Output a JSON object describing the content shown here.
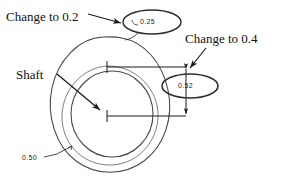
{
  "figure": {
    "background_color": "#ffffff",
    "line_color": "#3a3a3a",
    "text_color": "#111111"
  },
  "annotations": {
    "change_top": "Change to 0.2",
    "change_right": "Change to 0.4",
    "shaft": "Shaft"
  },
  "dimensions": {
    "top_value": "0.25",
    "right_value": "0.52",
    "bottom_value": "0.50"
  },
  "geometry": {
    "outer_teardrop": "egg/teardrop outline",
    "inner_circle": "shaft bore circle",
    "callout_ellipse_top": "oval around 0.25",
    "callout_ellipse_right": "oval around 0.52",
    "crosshair_upper": "center mark upper",
    "crosshair_lower": "center mark lower",
    "vertical_dimension_line": "dimension line with arrowheads"
  }
}
